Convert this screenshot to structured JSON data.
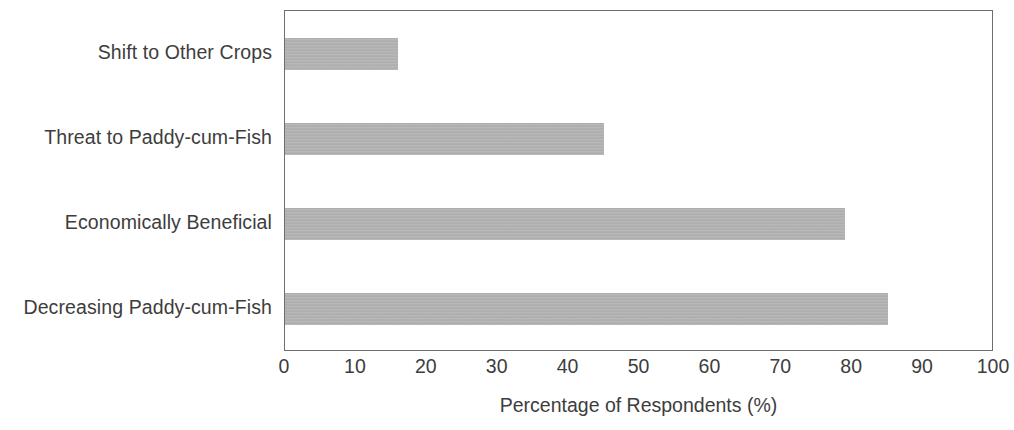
{
  "chart_data": {
    "type": "bar",
    "orientation": "horizontal",
    "title": "",
    "xlabel": "Percentage of Respondents (%)",
    "ylabel": "",
    "categories": [
      "Shift to Other Crops",
      "Threat to Paddy-cum-Fish",
      "Economically Beneficial",
      "Decreasing Paddy-cum-Fish"
    ],
    "values": [
      16,
      45,
      79,
      85
    ],
    "xlim": [
      0,
      100
    ],
    "xticks": [
      0,
      10,
      20,
      30,
      40,
      50,
      60,
      70,
      80,
      90,
      100
    ],
    "xtick_labels": [
      "0",
      "10",
      "20",
      "30",
      "40",
      "50",
      "60",
      "70",
      "80",
      "90",
      "100"
    ],
    "grid": false,
    "legend": false,
    "bar_color": "#b2b2b2",
    "frame_color": "#6e6e6e",
    "text_color": "#3d3d3d",
    "background": "#ffffff"
  }
}
